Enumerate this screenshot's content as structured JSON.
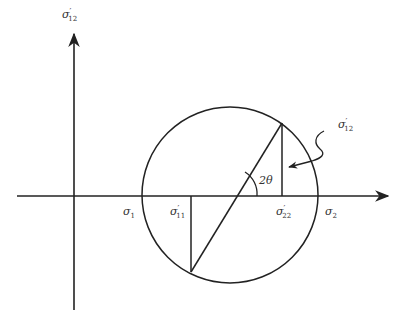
{
  "figure": {
    "type": "mohr-circle",
    "stroke_color": "#222222",
    "background": "#ffffff"
  },
  "axes": {
    "vertical_label": {
      "base": "σ",
      "prime": "′",
      "sub": "12"
    },
    "horizontal_label": ""
  },
  "labels": {
    "sigma1": {
      "base": "σ",
      "prime": "",
      "sub": "1"
    },
    "sigma2": {
      "base": "σ",
      "prime": "",
      "sub": "2"
    },
    "sigma11p": {
      "base": "σ",
      "prime": "′",
      "sub": "11"
    },
    "sigma22p": {
      "base": "σ",
      "prime": "′",
      "sub": "22"
    },
    "sigma12p_callout": {
      "base": "σ",
      "prime": "′",
      "sub": "12"
    },
    "angle": "2θ"
  },
  "geometry": {
    "circle_center": [
      230,
      196
    ],
    "circle_radius": 88,
    "axis_y": 196,
    "vertical_axis_x": 74,
    "chord_top": [
      282,
      123
    ],
    "chord_bottom": [
      191,
      272
    ]
  }
}
